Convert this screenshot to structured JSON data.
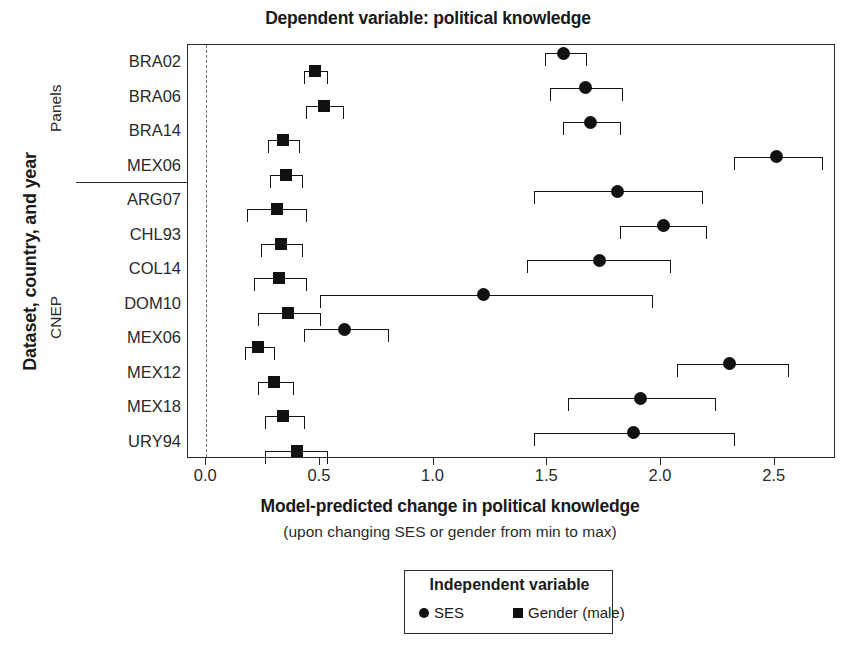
{
  "chart_data": {
    "type": "scatter",
    "title": "Dependent variable: political knowledge",
    "xlabel": "Model-predicted change in political knowledge",
    "xsublabel": "(upon changing SES or gender from min to max)",
    "ylabel": "Dataset, country, and year",
    "xlim": [
      -0.08,
      2.77
    ],
    "xticks": [
      0.0,
      0.5,
      1.0,
      1.5,
      2.0,
      2.5
    ],
    "xticklabels": [
      "0.0",
      "0.5",
      "1.0",
      "1.5",
      "2.0",
      "2.5"
    ],
    "grid": false,
    "zero_reference_line": 0.0,
    "legend": {
      "title": "Independent variable",
      "position": "below-axes",
      "entries": [
        {
          "label": "SES",
          "marker": "circle",
          "color": "#111111"
        },
        {
          "label": "Gender (male)",
          "marker": "square",
          "color": "#111111"
        }
      ]
    },
    "groups": [
      {
        "name": "Panels",
        "categories": [
          "BRA02",
          "BRA06",
          "BRA14",
          "MEX06"
        ]
      },
      {
        "name": "CNEP",
        "categories": [
          "ARG07",
          "CHL93",
          "COL14",
          "DOM10",
          "MEX06",
          "MEX12",
          "MEX18",
          "URY94"
        ]
      }
    ],
    "categories": [
      "BRA02",
      "BRA06",
      "BRA14",
      "MEX06",
      "ARG07",
      "CHL93",
      "COL14",
      "DOM10",
      "MEX06",
      "MEX12",
      "MEX18",
      "URY94"
    ],
    "series": [
      {
        "name": "SES",
        "marker": "circle",
        "values": [
          1.57,
          1.67,
          1.69,
          2.51,
          1.81,
          2.01,
          1.73,
          1.22,
          0.61,
          2.3,
          1.91,
          1.88
        ],
        "ci_low": [
          1.49,
          1.51,
          1.57,
          2.32,
          1.44,
          1.82,
          1.41,
          0.5,
          0.43,
          2.07,
          1.59,
          1.44
        ],
        "ci_high": [
          1.67,
          1.83,
          1.82,
          2.71,
          2.18,
          2.2,
          2.04,
          1.96,
          0.8,
          2.56,
          2.24,
          2.32
        ]
      },
      {
        "name": "Gender (male)",
        "marker": "square",
        "values": [
          0.48,
          0.52,
          0.34,
          0.35,
          0.31,
          0.33,
          0.32,
          0.36,
          0.23,
          0.3,
          0.34,
          0.4
        ],
        "ci_low": [
          0.43,
          0.44,
          0.27,
          0.28,
          0.18,
          0.24,
          0.21,
          0.23,
          0.17,
          0.23,
          0.26,
          0.26
        ],
        "ci_high": [
          0.53,
          0.6,
          0.41,
          0.42,
          0.44,
          0.42,
          0.44,
          0.5,
          0.3,
          0.38,
          0.43,
          0.53
        ]
      }
    ]
  }
}
